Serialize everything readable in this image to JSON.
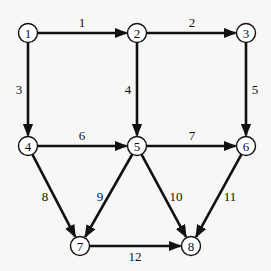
{
  "diagram": {
    "type": "directed-graph",
    "nodes": [
      {
        "id": "1",
        "label": "1",
        "x": 28,
        "y": 33
      },
      {
        "id": "2",
        "label": "2",
        "x": 137,
        "y": 33
      },
      {
        "id": "3",
        "label": "3",
        "x": 246,
        "y": 33
      },
      {
        "id": "4",
        "label": "4",
        "x": 28,
        "y": 146
      },
      {
        "id": "5",
        "label": "5",
        "x": 137,
        "y": 146
      },
      {
        "id": "6",
        "label": "6",
        "x": 246,
        "y": 146
      },
      {
        "id": "7",
        "label": "7",
        "x": 80,
        "y": 246
      },
      {
        "id": "8",
        "label": "8",
        "x": 191,
        "y": 246
      }
    ],
    "edges": [
      {
        "label": "1",
        "from": "1",
        "to": "2",
        "lx": 82,
        "ly": 22
      },
      {
        "label": "2",
        "from": "2",
        "to": "3",
        "lx": 192,
        "ly": 22
      },
      {
        "label": "3",
        "from": "1",
        "to": "4",
        "lx": 19,
        "ly": 89
      },
      {
        "label": "4",
        "from": "2",
        "to": "5",
        "lx": 128,
        "ly": 89
      },
      {
        "label": "5",
        "from": "3",
        "to": "6",
        "lx": 255,
        "ly": 89
      },
      {
        "label": "6",
        "from": "4",
        "to": "5",
        "lx": 82,
        "ly": 135
      },
      {
        "label": "7",
        "from": "5",
        "to": "6",
        "lx": 192,
        "ly": 135
      },
      {
        "label": "8",
        "from": "4",
        "to": "7",
        "lx": 45,
        "ly": 196
      },
      {
        "label": "9",
        "from": "5",
        "to": "7",
        "lx": 100,
        "ly": 196
      },
      {
        "label": "10",
        "from": "5",
        "to": "8",
        "lx": 176,
        "ly": 196
      },
      {
        "label": "11",
        "from": "6",
        "to": "8",
        "lx": 230,
        "ly": 196
      },
      {
        "label": "12",
        "from": "7",
        "to": "8",
        "lx": 135,
        "ly": 256
      }
    ]
  }
}
